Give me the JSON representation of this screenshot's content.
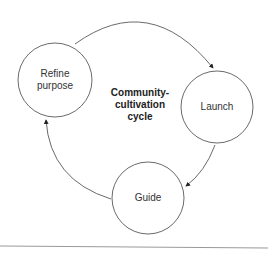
{
  "diagram": {
    "title_lines": [
      "Community-",
      "cultivation",
      "cycle"
    ],
    "nodes": [
      {
        "id": "refine",
        "label_lines": [
          "Refine",
          "purpose"
        ]
      },
      {
        "id": "launch",
        "label": "Launch"
      },
      {
        "id": "guide",
        "label": "Guide"
      }
    ],
    "edges": [
      {
        "from": "refine",
        "to": "launch"
      },
      {
        "from": "launch",
        "to": "guide"
      },
      {
        "from": "guide",
        "to": "refine"
      }
    ]
  }
}
